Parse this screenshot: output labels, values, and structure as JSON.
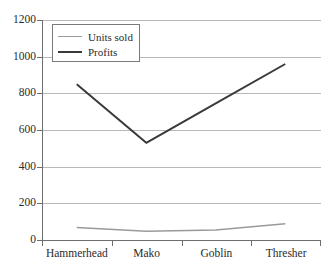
{
  "chart_data": {
    "type": "line",
    "title": "",
    "xlabel": "",
    "ylabel": "",
    "ylim": [
      0,
      1200
    ],
    "yticks": [
      0,
      200,
      400,
      600,
      800,
      1000,
      1200
    ],
    "grid": true,
    "legend_position": "top-left-inside",
    "categories": [
      "Hammerhead",
      "Mako",
      "Goblin",
      "Thresher"
    ],
    "series": [
      {
        "name": "Units sold",
        "values": [
          68,
          48,
          55,
          88
        ],
        "color": "#9a9a9a"
      },
      {
        "name": "Profits",
        "values": [
          850,
          530,
          745,
          960
        ],
        "color": "#3a3a3a"
      }
    ]
  },
  "axis": {
    "y_tick_labels": [
      "1200",
      "1000",
      "800",
      "600",
      "400",
      "200",
      "0"
    ],
    "x_tick_labels": [
      "Hammerhead",
      "Mako",
      "Goblin",
      "Thresher"
    ]
  },
  "legend": {
    "items": [
      {
        "label": "Units sold",
        "swatch": "line-swatch-units-sold"
      },
      {
        "label": "Profits",
        "swatch": "line-swatch-profits"
      }
    ]
  },
  "colors": {
    "units_sold": "#9a9a9a",
    "profits": "#3a3a3a",
    "gridline": "#b9b9b9",
    "axis": "#6e6e6e",
    "text": "#2b2b2b",
    "background": "#ffffff"
  }
}
